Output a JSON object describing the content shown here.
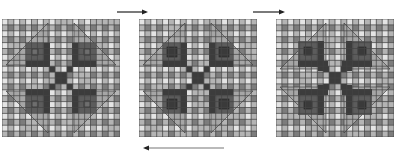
{
  "figure": {
    "panels": [
      {
        "id": "panel-1",
        "x": 2,
        "y": 19,
        "size": 118,
        "cells": 20,
        "variant": 1
      },
      {
        "id": "panel-2",
        "x": 139,
        "y": 19,
        "size": 118,
        "cells": 20,
        "variant": 2
      },
      {
        "id": "panel-3",
        "x": 276,
        "y": 19,
        "size": 118,
        "cells": 20,
        "variant": 3
      }
    ],
    "arrows": [
      {
        "id": "arrow-1-to-2",
        "direction": "right",
        "x1": 117,
        "x2": 146,
        "y": 12
      },
      {
        "id": "arrow-2-to-3",
        "direction": "right",
        "x1": 253,
        "x2": 283,
        "y": 12
      },
      {
        "id": "arrow-3-to-1",
        "direction": "left",
        "x1": 145,
        "x2": 224,
        "y": 148
      }
    ]
  },
  "colors": {
    "cell_light": "#e4e4e4",
    "cell_mid": "#b4b4b4",
    "cell_dark": "#7c7c7c",
    "grid_line": "#444444",
    "triangle": "#a6a6a6",
    "block": "#5c5c5c",
    "block_inner": "#3a3a3a",
    "diagonal": "#3c3c3c",
    "arrow_top": "#222222",
    "arrow_bottom": "#777777"
  }
}
